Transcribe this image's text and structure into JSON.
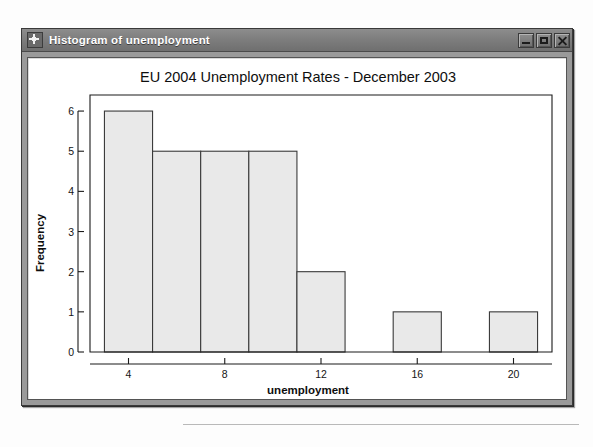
{
  "window": {
    "title": "Histogram of unemployment",
    "icon": "app-window-icon",
    "controls": {
      "minimize": "Minimize",
      "maximize": "Maximize",
      "close": "Close"
    }
  },
  "chart_data": {
    "type": "bar",
    "title": "EU 2004 Unemployment Rates - December 2003",
    "xlabel": "unemployment",
    "ylabel": "Frequency",
    "grid": false,
    "legend": null,
    "xlim": [
      2.4,
      21.6
    ],
    "ylim": [
      0,
      6.4
    ],
    "xticks": [
      4,
      8,
      12,
      16,
      20
    ],
    "xtick_labels": [
      "4",
      "8",
      "12",
      "16",
      "20"
    ],
    "yticks": [
      0,
      1,
      2,
      3,
      4,
      5,
      6
    ],
    "ytick_labels": [
      "0",
      "1",
      "2",
      "3",
      "4",
      "5",
      "6"
    ],
    "bin_width": 2,
    "bins": [
      {
        "start": 3,
        "end": 5,
        "label": "3-5",
        "value": 6
      },
      {
        "start": 5,
        "end": 7,
        "label": "5-7",
        "value": 5
      },
      {
        "start": 7,
        "end": 9,
        "label": "7-9",
        "value": 5
      },
      {
        "start": 9,
        "end": 11,
        "label": "9-11",
        "value": 5
      },
      {
        "start": 11,
        "end": 13,
        "label": "11-13",
        "value": 2
      },
      {
        "start": 13,
        "end": 15,
        "label": "13-15",
        "value": 0
      },
      {
        "start": 15,
        "end": 17,
        "label": "15-17",
        "value": 1
      },
      {
        "start": 17,
        "end": 19,
        "label": "17-19",
        "value": 0
      },
      {
        "start": 19,
        "end": 21,
        "label": "19-21",
        "value": 1
      }
    ],
    "values": [
      6,
      5,
      5,
      5,
      2,
      0,
      1,
      0,
      1
    ],
    "categories": [
      "3-5",
      "5-7",
      "7-9",
      "9-11",
      "11-13",
      "13-15",
      "15-17",
      "17-19",
      "19-21"
    ],
    "colors": {
      "bar_fill": "#e9e9e9",
      "bar_stroke": "#3a3a3a",
      "axis": "#1a1a1a",
      "background": "#ffffff"
    }
  }
}
